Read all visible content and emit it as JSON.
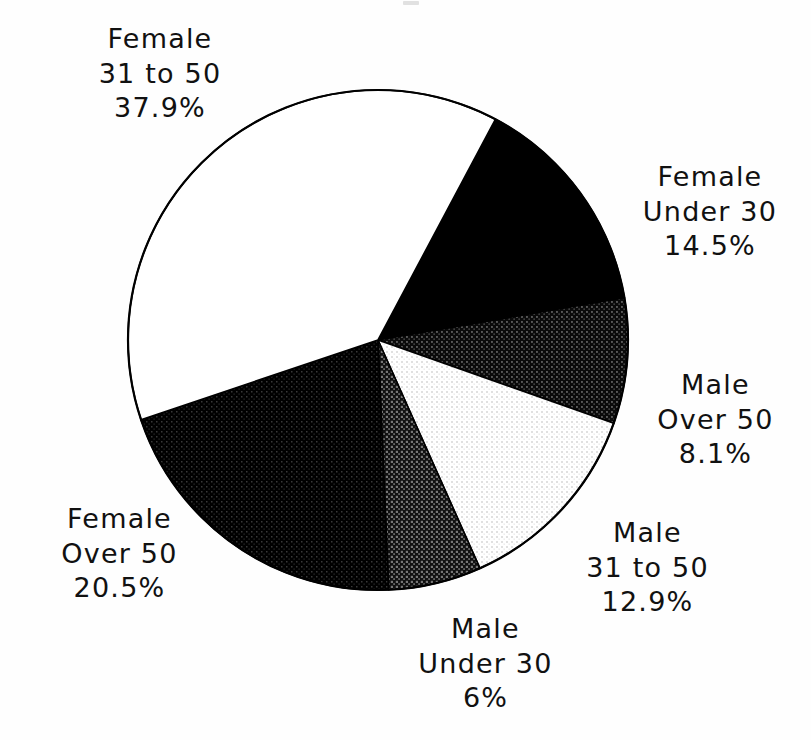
{
  "page": {
    "background_color": "#fefefe",
    "width": 811,
    "height": 740
  },
  "chart_data": {
    "type": "pie",
    "title": "",
    "subtitle": "",
    "xlabel": "",
    "ylabel": "",
    "legend_position": "none",
    "grid": false,
    "label_format": "category-lines + percent",
    "start_angle_deg_from_top": 28,
    "direction": "clockwise",
    "center_px": [
      378,
      340
    ],
    "radius_px": 250,
    "categories": [
      "Female Under 30",
      "Male Over 50",
      "Male 31 to 50",
      "Male Under 30",
      "Female Over 50",
      "Female 31 to 50"
    ],
    "values": [
      14.5,
      8.1,
      12.9,
      6,
      20.5,
      37.9
    ],
    "value_labels": [
      "14.5%",
      "8.1%",
      "12.9%",
      "6%",
      "20.5%",
      "37.9%"
    ],
    "slices": [
      {
        "id": "female-under-30",
        "label_lines": [
          "Female",
          "Under 30",
          "14.5%"
        ],
        "group": "Female",
        "age_band": "Under 30",
        "value": 14.5,
        "value_label": "14.5%",
        "fill": "solid-black",
        "fill_color": "#000000",
        "tone_percent": 100
      },
      {
        "id": "male-over-50",
        "label_lines": [
          "Male",
          "Over 50",
          "8.1%"
        ],
        "group": "Male",
        "age_band": "Over 50",
        "value": 8.1,
        "value_label": "8.1%",
        "fill": "dark-halftone",
        "fill_color": "#1c1c1c",
        "tone_percent": 85
      },
      {
        "id": "male-31-to-50",
        "label_lines": [
          "Male",
          "31 to 50",
          "12.9%"
        ],
        "group": "Male",
        "age_band": "31 to 50",
        "value": 12.9,
        "value_label": "12.9%",
        "fill": "light-halftone",
        "fill_color": "#ededed",
        "tone_percent": 12
      },
      {
        "id": "male-under-30",
        "label_lines": [
          "Male",
          "Under 30",
          "6%"
        ],
        "group": "Male",
        "age_band": "Under 30",
        "value": 6,
        "value_label": "6%",
        "fill": "medium-dark-halftone",
        "fill_color": "#2e2e2e",
        "tone_percent": 72
      },
      {
        "id": "female-over-50",
        "label_lines": [
          "Female",
          "Over 50",
          "20.5%"
        ],
        "group": "Female",
        "age_band": "Over 50",
        "value": 20.5,
        "value_label": "20.5%",
        "fill": "very-dark-halftone",
        "fill_color": "#0d0d0d",
        "tone_percent": 93
      },
      {
        "id": "female-31-to-50",
        "label_lines": [
          "Female",
          "31 to 50",
          "37.9%"
        ],
        "group": "Female",
        "age_band": "31 to 50",
        "value": 37.9,
        "value_label": "37.9%",
        "fill": "white",
        "fill_color": "#ffffff",
        "tone_percent": 0
      }
    ],
    "outline_color": "#000000",
    "total": 99.9
  },
  "labels": {
    "female_31_to_50": {
      "line1": "Female",
      "line2": "31 to 50",
      "line3": "37.9%"
    },
    "female_under_30": {
      "line1": "Female",
      "line2": "Under 30",
      "line3": "14.5%"
    },
    "male_over_50": {
      "line1": "Male",
      "line2": "Over 50",
      "line3": "8.1%"
    },
    "male_31_to_50": {
      "line1": "Male",
      "line2": "31 to 50",
      "line3": "12.9%"
    },
    "male_under_30": {
      "line1": "Male",
      "line2": "Under 30",
      "line3": "6%"
    },
    "female_over_50": {
      "line1": "Female",
      "line2": "Over 50",
      "line3": "20.5%"
    }
  }
}
